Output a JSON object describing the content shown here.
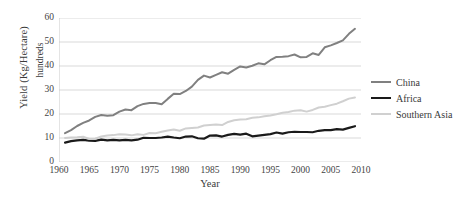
{
  "chart_data": {
    "type": "line",
    "title": "",
    "xlabel": "Year",
    "ylabel": "Yield (Kg/Hectare)",
    "ylabel_secondary": "hundreds",
    "xlim": [
      1960,
      2010
    ],
    "ylim": [
      0,
      60
    ],
    "grid": true,
    "legend_position": "right",
    "xticks": [
      1960,
      1965,
      1970,
      1975,
      1980,
      1985,
      1990,
      1995,
      2000,
      2005,
      2010
    ],
    "yticks": [
      0,
      10,
      20,
      30,
      40,
      50,
      60
    ],
    "x": [
      1961,
      1962,
      1963,
      1964,
      1965,
      1966,
      1967,
      1968,
      1969,
      1970,
      1971,
      1972,
      1973,
      1974,
      1975,
      1976,
      1977,
      1978,
      1979,
      1980,
      1981,
      1982,
      1983,
      1984,
      1985,
      1986,
      1987,
      1988,
      1989,
      1990,
      1991,
      1992,
      1993,
      1994,
      1995,
      1996,
      1997,
      1998,
      1999,
      2000,
      2001,
      2002,
      2003,
      2004,
      2005,
      2006,
      2007,
      2008,
      2009
    ],
    "series": [
      {
        "name": "China",
        "color": "#808080",
        "width": 2.0,
        "values": [
          12.0,
          13.3,
          15.0,
          16.3,
          17.3,
          18.8,
          19.6,
          19.3,
          19.5,
          21.0,
          21.9,
          21.6,
          23.3,
          24.2,
          24.6,
          24.6,
          24.1,
          26.3,
          28.4,
          28.3,
          29.6,
          31.4,
          34.2,
          36.0,
          35.2,
          36.3,
          37.4,
          36.8,
          38.4,
          39.8,
          39.4,
          40.1,
          41.1,
          40.7,
          42.4,
          43.8,
          43.9,
          44.1,
          44.8,
          43.6,
          43.8,
          45.3,
          44.6,
          47.8,
          48.6,
          49.6,
          50.7,
          53.4,
          55.5
        ]
      },
      {
        "name": "Africa",
        "color": "#1a1a1a",
        "width": 2.2,
        "values": [
          8.1,
          8.7,
          9.0,
          9.2,
          8.9,
          8.8,
          9.3,
          9.0,
          9.2,
          9.0,
          9.2,
          9.0,
          9.3,
          10.1,
          10.0,
          10.0,
          10.2,
          10.6,
          10.2,
          9.9,
          10.6,
          10.7,
          9.9,
          9.7,
          11.0,
          11.1,
          10.6,
          11.3,
          11.7,
          11.4,
          11.8,
          10.7,
          11.0,
          11.3,
          11.6,
          12.3,
          11.8,
          12.4,
          12.6,
          12.5,
          12.5,
          12.4,
          13.0,
          13.3,
          13.3,
          13.7,
          13.5,
          14.2,
          14.9
        ]
      },
      {
        "name": "Southern Asia",
        "color": "#d0d0d0",
        "width": 2.0,
        "values": [
          10.0,
          10.2,
          10.3,
          10.5,
          9.6,
          9.7,
          10.6,
          11.0,
          11.2,
          11.6,
          11.5,
          11.1,
          11.6,
          11.3,
          12.1,
          12.0,
          12.6,
          13.1,
          13.5,
          13.0,
          14.0,
          14.2,
          14.4,
          15.2,
          15.4,
          15.6,
          15.4,
          16.7,
          17.4,
          17.7,
          17.8,
          18.4,
          18.6,
          19.1,
          19.4,
          19.9,
          20.5,
          20.8,
          21.4,
          21.6,
          21.0,
          21.7,
          22.7,
          23.0,
          23.7,
          24.3,
          25.3,
          26.4,
          26.9
        ]
      }
    ]
  },
  "legend": {
    "items": [
      {
        "label": "China"
      },
      {
        "label": "Africa"
      },
      {
        "label": "Southern Asia"
      }
    ]
  },
  "axes": {
    "y_title": "Yield (Kg/Hectare)",
    "y_subtitle": "hundreds",
    "x_title": "Year"
  }
}
